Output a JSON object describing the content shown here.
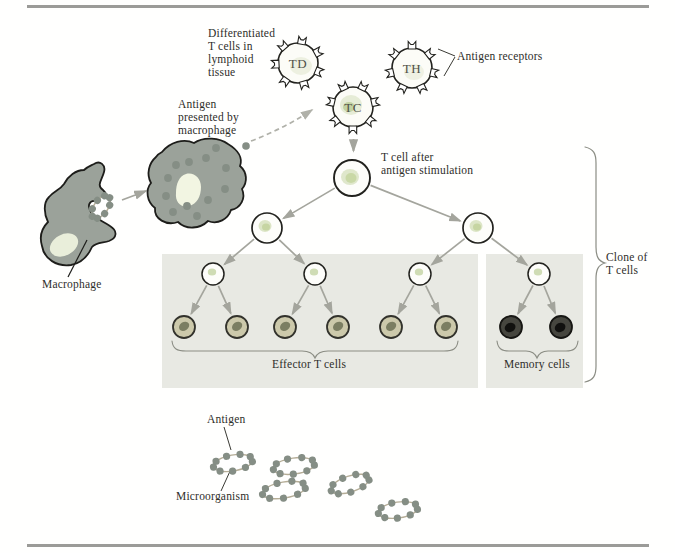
{
  "figure_type": "Clonal selection of T cells diagram",
  "labels": {
    "differentiated_t_cells": "Differentiated\nT cells in\nlymphoid\ntissue",
    "antigen_receptors": "Antigen receptors",
    "antigen_presented": "Antigen\npresented by\nmacrophage",
    "t_cell_after_stimulation": "T cell after\nantigen stimulation",
    "macrophage": "Macrophage",
    "effector_t_cells": "Effector T cells",
    "memory_cells": "Memory cells",
    "clone_of_t_cells": "Clone of\nT cells",
    "antigen": "Antigen",
    "microorganism": "Microorganism"
  },
  "cell_labels": {
    "td": "TD",
    "tc": "TC",
    "th": "TH"
  },
  "structure": {
    "differentiated_cell_types": [
      "TD",
      "TC",
      "TH"
    ],
    "clone_tree_generations": [
      1,
      2,
      4,
      8
    ],
    "effector_cell_count": 6,
    "memory_cell_count": 2,
    "free_microorganism_count": 5
  },
  "colors": {
    "macrophage_body": "#9ba29a",
    "macrophage_nucleus": "#e9eeda",
    "antigen_dot": "#858e85",
    "effector_cell_fill": "#ccc9ab",
    "effector_nucleus": "#7b7e62",
    "memory_cell_fill": "#46463f",
    "t_cell_nucleus": "#c6d5a2",
    "shaded_box": "#e8e9e3",
    "arrow": "#a4a59d",
    "rule": "#9b9b98",
    "text": "#2e2e2a"
  }
}
